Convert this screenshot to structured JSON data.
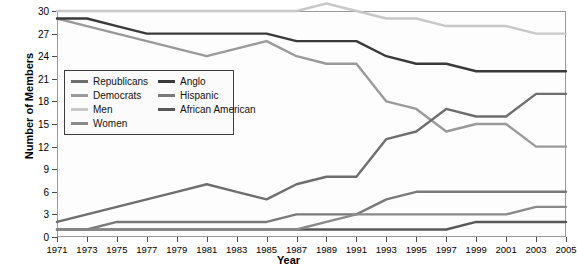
{
  "chart_data": {
    "type": "line",
    "title": "",
    "xlabel": "Year",
    "ylabel": "Number of Members",
    "x": [
      1971,
      1973,
      1975,
      1977,
      1979,
      1981,
      1983,
      1985,
      1987,
      1989,
      1991,
      1993,
      1995,
      1997,
      1999,
      2001,
      2003,
      2005
    ],
    "xlim": [
      1971,
      2005
    ],
    "ylim": [
      0,
      30
    ],
    "yticks": [
      0,
      3,
      6,
      9,
      12,
      15,
      18,
      21,
      24,
      27,
      30
    ],
    "xticks": [
      "1971",
      "1973",
      "1975",
      "1977",
      "1979",
      "1981",
      "1983",
      "1985",
      "1987",
      "1989",
      "1991",
      "1993",
      "1995",
      "1997",
      "1999",
      "2001",
      "2003",
      "2005"
    ],
    "grid": false,
    "legend_position": "upper-left-inside",
    "series": [
      {
        "name": "Republicans",
        "color": "#6e6e6e",
        "values": [
          2,
          3,
          4,
          5,
          6,
          7,
          6,
          5,
          7,
          8,
          8,
          13,
          14,
          17,
          16,
          16,
          19,
          19
        ]
      },
      {
        "name": "Democrats",
        "color": "#9a9a9a",
        "values": [
          29,
          28,
          27,
          26,
          25,
          24,
          25,
          26,
          24,
          23,
          23,
          18,
          17,
          14,
          15,
          15,
          12,
          12
        ]
      },
      {
        "name": "Men",
        "color": "#c8c8c8",
        "values": [
          30,
          30,
          30,
          30,
          30,
          30,
          30,
          30,
          30,
          31,
          30,
          29,
          29,
          28,
          28,
          28,
          27,
          27
        ]
      },
      {
        "name": "Women",
        "color": "#8a8a8a",
        "values": [
          1,
          1,
          1,
          1,
          1,
          1,
          1,
          1,
          1,
          2,
          3,
          3,
          3,
          3,
          3,
          3,
          4,
          4
        ]
      },
      {
        "name": "Anglo",
        "color": "#3a3a3a",
        "values": [
          29,
          29,
          28,
          27,
          27,
          27,
          27,
          27,
          26,
          26,
          26,
          24,
          23,
          23,
          22,
          22,
          22,
          22
        ]
      },
      {
        "name": "Hispanic",
        "color": "#7a7a7a",
        "values": [
          1,
          1,
          2,
          2,
          2,
          2,
          2,
          2,
          3,
          3,
          3,
          5,
          6,
          6,
          6,
          6,
          6,
          6
        ]
      },
      {
        "name": "African American",
        "color": "#585858",
        "values": [
          1,
          1,
          1,
          1,
          1,
          1,
          1,
          1,
          1,
          1,
          1,
          1,
          1,
          1,
          2,
          2,
          2,
          2
        ]
      }
    ]
  },
  "legend": {
    "columns": [
      [
        "Republicans",
        "Democrats",
        "Men",
        "Women"
      ],
      [
        "Anglo",
        "Hispanic",
        "African American"
      ]
    ]
  },
  "axis": {
    "x_title": "Year",
    "y_title": "Number of Members"
  }
}
